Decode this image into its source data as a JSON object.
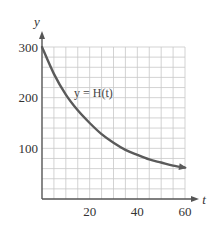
{
  "chart_data": {
    "type": "line",
    "title": "",
    "xlabel": "t",
    "ylabel": "y",
    "xlim": [
      0,
      60
    ],
    "ylim": [
      0,
      300
    ],
    "grid": true,
    "grid_x_step": 5,
    "grid_y_step": 20,
    "x_ticks": [
      20,
      40,
      60
    ],
    "x_tick_labels": [
      "20",
      "40",
      "60"
    ],
    "y_ticks": [
      100,
      200,
      300
    ],
    "y_tick_labels": [
      "100",
      "200",
      "300"
    ],
    "series": [
      {
        "name": "y = H(t)",
        "x": [
          0,
          5,
          10,
          15,
          20,
          25,
          30,
          35,
          40,
          45,
          50,
          55,
          60
        ],
        "values": [
          300,
          247,
          206,
          175,
          150,
          128,
          111,
          97,
          87,
          78,
          72,
          66,
          62
        ]
      }
    ],
    "annotations": [
      {
        "text": "y = H(t)",
        "x": 26,
        "y": 210
      }
    ],
    "legend": "none"
  },
  "labels": {
    "y_axis": "y",
    "x_axis": "t",
    "curve": "y = H(t)"
  },
  "colors": {
    "curve": "#5a5a5a",
    "grid": "#c8c8c8",
    "axis": "#555555",
    "text": "#333333"
  }
}
